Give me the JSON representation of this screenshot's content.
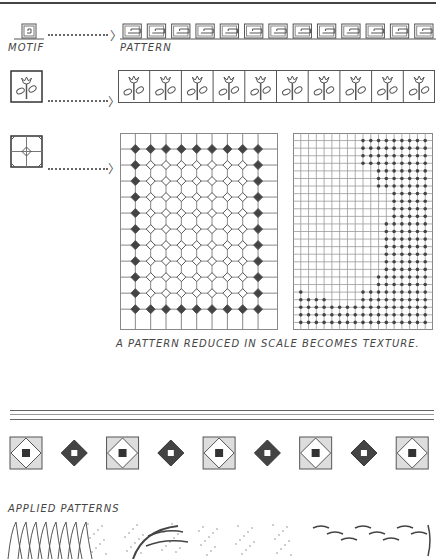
{
  "labels": {
    "motif": "MOTIF",
    "pattern": "PATTERN",
    "caption": "A PATTERN REDUCED IN SCALE BECOMES TEXTURE.",
    "applied": "APPLIED PATTERNS"
  },
  "rows": [
    {
      "motif": "greek-key-spiral",
      "repeat_count": 13
    },
    {
      "motif": "tulip",
      "repeat_count": 10
    },
    {
      "motif": "grid-diamond",
      "pattern": "grid-with-diamond-nodes",
      "grid_cols": 9,
      "grid_rows": 11
    }
  ],
  "texture_grid": {
    "cols": 18,
    "rows": 26
  },
  "border_band": {
    "motifs": [
      "square-diamond",
      "solid-diamond",
      "square-diamond",
      "solid-diamond",
      "square-diamond",
      "solid-diamond",
      "square-diamond",
      "solid-diamond",
      "square-diamond"
    ]
  },
  "colors": {
    "ink": "#444444",
    "paper": "#ffffff"
  }
}
